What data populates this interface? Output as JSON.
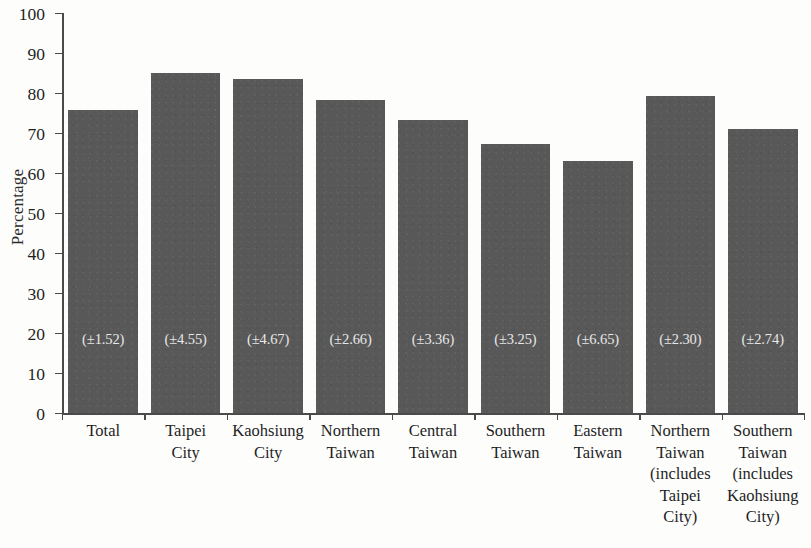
{
  "chart_data": {
    "type": "bar",
    "title": "",
    "xlabel": "",
    "ylabel": "Percentage",
    "ylim": [
      0,
      100
    ],
    "ytick_step": 10,
    "yticks": [
      "0",
      "10",
      "20",
      "30",
      "40",
      "50",
      "60",
      "70",
      "80",
      "90",
      "100"
    ],
    "grid": false,
    "legend": null,
    "bar_color": "#585858",
    "axis_color": "#4a4a4a",
    "annotation_color": "#e8e8e8",
    "categories": [
      "Total",
      "Taipei City",
      "Kaohsiung City",
      "Northern Taiwan",
      "Central Taiwan",
      "Southern Taiwan",
      "Eastern Taiwan",
      "Northern Taiwan (includes Taipei City)",
      "Southern Taiwan (includes Kaohsiung City)"
    ],
    "category_lines": [
      [
        "Total"
      ],
      [
        "Taipei",
        "City"
      ],
      [
        "Kaohsiung",
        "City"
      ],
      [
        "Northern",
        "Taiwan"
      ],
      [
        "Central",
        "Taiwan"
      ],
      [
        "Southern",
        "Taiwan"
      ],
      [
        "Eastern",
        "Taiwan"
      ],
      [
        "Northern",
        "Taiwan",
        "(includes",
        "Taipei",
        "City)"
      ],
      [
        "Southern",
        "Taiwan",
        "(includes",
        "Kaohsiung",
        "City)"
      ]
    ],
    "values": [
      75.8,
      85.0,
      83.5,
      78.3,
      73.3,
      67.3,
      63.0,
      79.3,
      71.0
    ],
    "errors": [
      1.52,
      4.55,
      4.67,
      2.66,
      3.36,
      3.25,
      6.65,
      2.3,
      2.74
    ],
    "error_labels": [
      "(±1.52)",
      "(±4.55)",
      "(±4.67)",
      "(±2.66)",
      "(±3.36)",
      "(±3.25)",
      "(±6.65)",
      "(±2.30)",
      "(±2.74)"
    ]
  }
}
